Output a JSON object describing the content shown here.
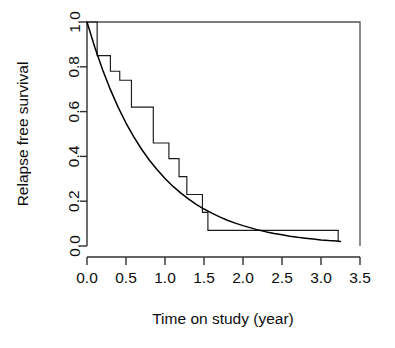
{
  "figure": {
    "name": "relapse-free-survival-plot",
    "background_color": "#ffffff",
    "line_color": "#000000"
  },
  "chart_data": {
    "type": "line",
    "title": "",
    "subtitle": "",
    "xlabel": "Time on study (year)",
    "ylabel": "Relapse free survival",
    "xlim": [
      0.0,
      3.5
    ],
    "ylim": [
      0.0,
      1.0
    ],
    "xticks": [
      0.0,
      0.5,
      1.0,
      1.5,
      2.0,
      2.5,
      3.0,
      3.5
    ],
    "xticklabels": [
      "0.0",
      "0.5",
      "1.0",
      "1.5",
      "2.0",
      "2.5",
      "3.0",
      "3.5"
    ],
    "yticks": [
      0.0,
      0.2,
      0.4,
      0.6,
      0.8,
      1.0
    ],
    "yticklabels": [
      "0.0",
      "0.2",
      "0.4",
      "0.6",
      "0.8",
      "1.0"
    ],
    "grid": false,
    "legend": false,
    "legend_position": "none",
    "series": [
      {
        "name": "Kaplan-Meier estimate",
        "type": "step",
        "step_mode": "post",
        "x": [
          0.0,
          0.13,
          0.3,
          0.42,
          0.57,
          0.85,
          1.05,
          1.18,
          1.28,
          1.48,
          1.55,
          3.22,
          3.22
        ],
        "y": [
          1.0,
          0.85,
          0.78,
          0.74,
          0.62,
          0.46,
          0.39,
          0.31,
          0.23,
          0.15,
          0.07,
          0.07,
          0.02
        ]
      },
      {
        "name": "Fitted exponential survival curve",
        "type": "line",
        "formula": "S(t) = exp(-1.2 t)",
        "x": [
          0.0,
          0.1,
          0.2,
          0.3,
          0.4,
          0.5,
          0.6,
          0.7,
          0.8,
          0.9,
          1.0,
          1.1,
          1.2,
          1.3,
          1.4,
          1.5,
          1.6,
          1.7,
          1.8,
          1.9,
          2.0,
          2.1,
          2.2,
          2.3,
          2.4,
          2.5,
          2.6,
          2.7,
          2.8,
          2.9,
          3.0,
          3.1,
          3.2,
          3.25
        ],
        "y": [
          1.0,
          0.887,
          0.787,
          0.698,
          0.619,
          0.549,
          0.487,
          0.432,
          0.383,
          0.34,
          0.301,
          0.267,
          0.237,
          0.21,
          0.186,
          0.165,
          0.147,
          0.13,
          0.115,
          0.102,
          0.091,
          0.081,
          0.071,
          0.063,
          0.056,
          0.05,
          0.044,
          0.039,
          0.035,
          0.031,
          0.027,
          0.024,
          0.022,
          0.02
        ]
      }
    ]
  },
  "axes": {
    "x_tick_labels": [
      "0.0",
      "0.5",
      "1.0",
      "1.5",
      "2.0",
      "2.5",
      "3.0",
      "3.5"
    ],
    "y_tick_labels": [
      "0.0",
      "0.2",
      "0.4",
      "0.6",
      "0.8",
      "1.0"
    ],
    "x_axis_title": "Time on study (year)",
    "y_axis_title": "Relapse free survival"
  }
}
